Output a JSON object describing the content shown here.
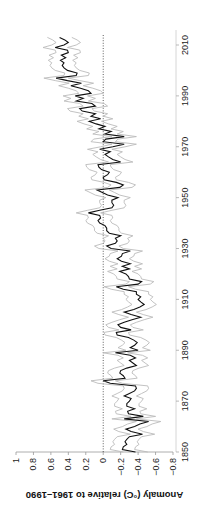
{
  "chart_data": {
    "type": "line",
    "orientation": "rotated-90-clockwise",
    "title": "",
    "xlabel": "",
    "ylabel": "Anomaly (°C) relative to 1961–1990",
    "xlim": [
      1850,
      2014
    ],
    "ylim": [
      -0.8,
      1.0
    ],
    "xticks": [
      1850,
      1870,
      1890,
      1910,
      1930,
      1950,
      1970,
      1990,
      2010
    ],
    "yticks": [
      -0.8,
      -0.6,
      -0.4,
      -0.2,
      0,
      0.2,
      0.4,
      0.6,
      0.8,
      1
    ],
    "ytick_labels": [
      "−0.8",
      "−0.6",
      "−0.4",
      "−0.2",
      "0",
      "0.2",
      "0.4",
      "0.6",
      "0.8",
      "1"
    ],
    "reference_line": {
      "value": 0,
      "style": "dotted"
    },
    "grid": false,
    "legend": null,
    "x_start": 1850,
    "series": [
      {
        "name": "annual mean anomaly",
        "color": "#111111",
        "values": [
          -0.37,
          -0.22,
          -0.23,
          -0.27,
          -0.25,
          -0.27,
          -0.3,
          -0.45,
          -0.32,
          -0.26,
          -0.36,
          -0.42,
          -0.52,
          -0.24,
          -0.46,
          -0.29,
          -0.28,
          -0.36,
          -0.27,
          -0.27,
          -0.3,
          -0.32,
          -0.24,
          -0.3,
          -0.36,
          -0.38,
          -0.37,
          -0.08,
          0.0,
          -0.25,
          -0.23,
          -0.19,
          -0.2,
          -0.27,
          -0.38,
          -0.34,
          -0.3,
          -0.37,
          -0.31,
          -0.14,
          -0.4,
          -0.31,
          -0.36,
          -0.39,
          -0.35,
          -0.29,
          -0.16,
          -0.15,
          -0.32,
          -0.2,
          -0.17,
          -0.24,
          -0.33,
          -0.43,
          -0.32,
          -0.24,
          -0.35,
          -0.42,
          -0.47,
          -0.43,
          -0.4,
          -0.43,
          -0.38,
          -0.38,
          -0.23,
          -0.15,
          -0.4,
          -0.44,
          -0.3,
          -0.29,
          -0.26,
          -0.19,
          -0.3,
          -0.22,
          -0.31,
          -0.21,
          -0.16,
          -0.21,
          -0.22,
          -0.31,
          -0.09,
          -0.04,
          -0.14,
          -0.16,
          -0.14,
          -0.2,
          -0.07,
          -0.04,
          -0.04,
          -0.02,
          0.04,
          0.06,
          0.03,
          0.04,
          0.17,
          0.04,
          -0.1,
          -0.12,
          -0.1,
          -0.1,
          -0.17,
          -0.05,
          0.01,
          0.07,
          -0.19,
          -0.23,
          -0.15,
          -0.01,
          0.0,
          -0.05,
          -0.07,
          0.02,
          0.05,
          0.06,
          -0.2,
          -0.11,
          -0.06,
          -0.02,
          -0.08,
          0.04,
          -0.11,
          -0.24,
          0.0,
          -0.03,
          -0.24,
          -0.02,
          -0.09,
          0.05,
          -0.02,
          0.08,
          0.16,
          0.03,
          0.14,
          0.09,
          0.24,
          0.27,
          0.09,
          0.13,
          0.31,
          0.23,
          0.32,
          0.14,
          0.17,
          0.26,
          0.37,
          0.25,
          0.41,
          0.54,
          0.31,
          0.3,
          0.41,
          0.45,
          0.47,
          0.45,
          0.49,
          0.43,
          0.48,
          0.4,
          0.41,
          0.55,
          0.45,
          0.4,
          0.44,
          0.5
        ]
      },
      {
        "name": "upper uncertainty bound",
        "color": "#bbbbbb",
        "offset_from_mean": 0.14
      },
      {
        "name": "lower uncertainty bound",
        "color": "#bbbbbb",
        "offset_from_mean": -0.14
      }
    ]
  },
  "layout": {
    "value_axis_pixels": {
      "value_at_1": 16,
      "value_at_minus_0_8": 173,
      "axis_y": 452
    },
    "time_axis_pixels": {
      "year_1850_y": 452,
      "year_2010_y": 45,
      "axis_x": 176
    }
  }
}
